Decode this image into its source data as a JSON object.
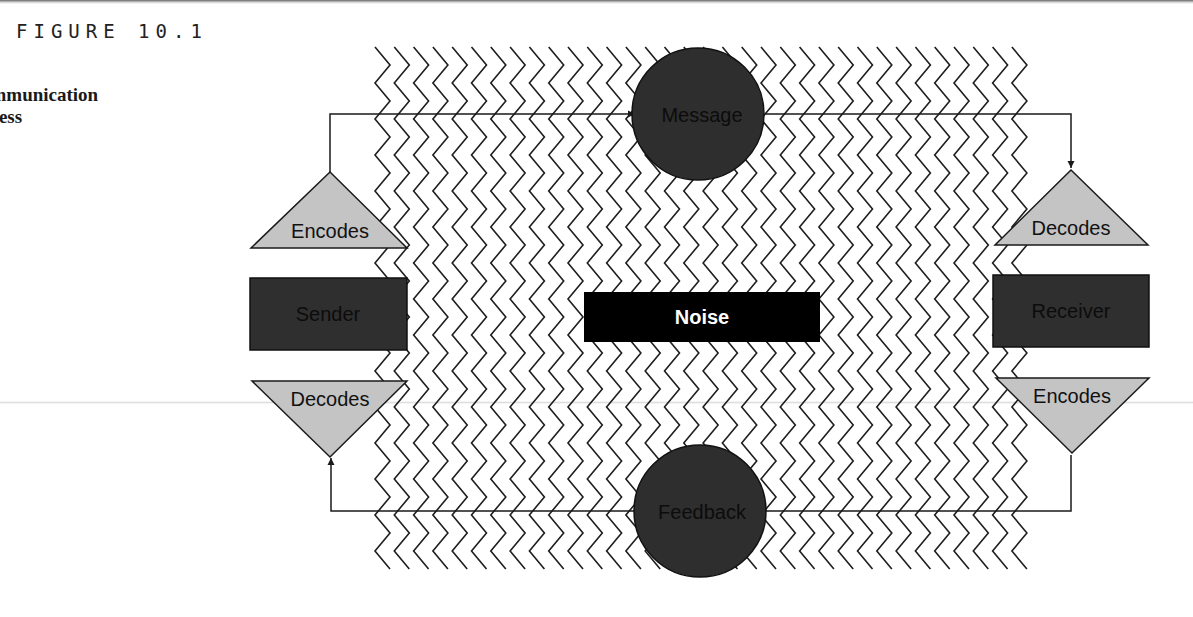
{
  "figure": {
    "number_label": "FIGURE 10.1",
    "title_lines": [
      "he",
      "ommunication",
      "ocess"
    ]
  },
  "diagram": {
    "noise": {
      "label": "Noise",
      "fill": "#000000",
      "text_color": "#ffffff"
    },
    "message": {
      "label": "Message",
      "fill": "#2e2e2e"
    },
    "feedback": {
      "label": "Feedback",
      "fill": "#2e2e2e"
    },
    "sender": {
      "label": "Sender",
      "fill": "#2f2f2f",
      "encodes_label": "Encodes",
      "decodes_label": "Decodes"
    },
    "receiver": {
      "label": "Receiver",
      "fill": "#2f2f2f",
      "decodes_label": "Decodes",
      "encodes_label": "Encodes"
    },
    "triangle_fill": "#c4c4c4",
    "line_color": "#1a1a1a",
    "zigzag": {
      "columns": 34,
      "start_x": 375,
      "spacing_x": 19.3,
      "top_y": 47,
      "bottom_y": 580,
      "amplitude_x": 15,
      "half_period_y": 18
    }
  }
}
